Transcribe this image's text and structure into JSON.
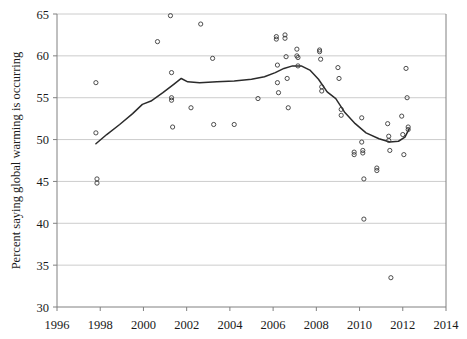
{
  "chart_data": {
    "type": "scatter",
    "title": "",
    "subtitle": "",
    "xlabel": "",
    "ylabel": "Percent saying global warming is occurring",
    "xlim": [
      1996,
      2014
    ],
    "ylim": [
      30,
      65
    ],
    "xticks": [
      1996,
      1998,
      2000,
      2002,
      2004,
      2006,
      2008,
      2010,
      2012,
      2014
    ],
    "xtick_labels": [
      "1996",
      "1998",
      "2000",
      "2002",
      "2004",
      "2006",
      "2008",
      "2010",
      "2012",
      "2014"
    ],
    "yticks": [
      30,
      35,
      40,
      45,
      50,
      55,
      60,
      65
    ],
    "ytick_labels": [
      "30",
      "35",
      "40",
      "45",
      "50",
      "55",
      "60",
      "65"
    ],
    "grid": "horizontal",
    "legend": "none",
    "series": [
      {
        "name": "Survey results",
        "marker": "open-circle",
        "points": [
          [
            1997.8,
            56.8
          ],
          [
            1997.8,
            50.8
          ],
          [
            1997.85,
            45.3
          ],
          [
            1997.85,
            44.8
          ],
          [
            2000.65,
            61.7
          ],
          [
            2001.25,
            64.8
          ],
          [
            2001.3,
            58.0
          ],
          [
            2001.3,
            55.0
          ],
          [
            2001.3,
            54.7
          ],
          [
            2001.35,
            51.5
          ],
          [
            2002.2,
            53.8
          ],
          [
            2002.65,
            63.8
          ],
          [
            2003.2,
            59.7
          ],
          [
            2003.25,
            51.8
          ],
          [
            2004.2,
            51.8
          ],
          [
            2005.3,
            54.9
          ],
          [
            2006.15,
            62.3
          ],
          [
            2006.15,
            62.0
          ],
          [
            2006.2,
            58.9
          ],
          [
            2006.2,
            56.8
          ],
          [
            2006.25,
            55.6
          ],
          [
            2006.55,
            62.5
          ],
          [
            2006.55,
            62.1
          ],
          [
            2006.6,
            59.9
          ],
          [
            2006.65,
            57.3
          ],
          [
            2006.7,
            53.8
          ],
          [
            2007.1,
            60.8
          ],
          [
            2007.1,
            60.0
          ],
          [
            2007.15,
            59.8
          ],
          [
            2007.15,
            58.8
          ],
          [
            2008.15,
            60.7
          ],
          [
            2008.15,
            60.5
          ],
          [
            2008.2,
            59.6
          ],
          [
            2008.25,
            56.3
          ],
          [
            2008.25,
            55.8
          ],
          [
            2009.0,
            58.6
          ],
          [
            2009.05,
            57.3
          ],
          [
            2009.15,
            53.6
          ],
          [
            2009.15,
            52.9
          ],
          [
            2009.75,
            48.5
          ],
          [
            2009.75,
            48.2
          ],
          [
            2010.1,
            52.6
          ],
          [
            2010.1,
            49.7
          ],
          [
            2010.15,
            48.7
          ],
          [
            2010.15,
            48.4
          ],
          [
            2010.2,
            45.3
          ],
          [
            2010.2,
            40.5
          ],
          [
            2010.8,
            46.6
          ],
          [
            2010.8,
            46.3
          ],
          [
            2011.3,
            51.9
          ],
          [
            2011.35,
            50.4
          ],
          [
            2011.35,
            49.9
          ],
          [
            2011.4,
            48.7
          ],
          [
            2011.45,
            33.5
          ],
          [
            2011.95,
            52.8
          ],
          [
            2012.0,
            50.6
          ],
          [
            2012.05,
            48.2
          ],
          [
            2012.15,
            58.5
          ],
          [
            2012.2,
            55.0
          ],
          [
            2012.25,
            51.5
          ],
          [
            2012.25,
            51.2
          ]
        ]
      },
      {
        "name": "Smoothed trend",
        "marker": "none",
        "line_points": [
          [
            1997.8,
            49.5
          ],
          [
            1998.3,
            50.6
          ],
          [
            1998.9,
            51.8
          ],
          [
            1999.5,
            53.1
          ],
          [
            1999.95,
            54.2
          ],
          [
            2000.35,
            54.6
          ],
          [
            2000.9,
            55.6
          ],
          [
            2001.4,
            56.6
          ],
          [
            2001.75,
            57.3
          ],
          [
            2002.05,
            56.9
          ],
          [
            2002.6,
            56.8
          ],
          [
            2003.4,
            56.9
          ],
          [
            2004.2,
            57.0
          ],
          [
            2005.0,
            57.2
          ],
          [
            2005.6,
            57.5
          ],
          [
            2006.1,
            58.0
          ],
          [
            2006.5,
            58.5
          ],
          [
            2006.9,
            58.8
          ],
          [
            2007.3,
            58.8
          ],
          [
            2007.7,
            58.3
          ],
          [
            2008.1,
            57.2
          ],
          [
            2008.5,
            55.7
          ],
          [
            2008.9,
            54.9
          ],
          [
            2009.3,
            53.3
          ],
          [
            2009.8,
            51.9
          ],
          [
            2010.3,
            50.8
          ],
          [
            2010.9,
            50.1
          ],
          [
            2011.4,
            49.7
          ],
          [
            2011.8,
            49.8
          ],
          [
            2012.1,
            50.3
          ],
          [
            2012.3,
            51.3
          ]
        ]
      }
    ]
  }
}
